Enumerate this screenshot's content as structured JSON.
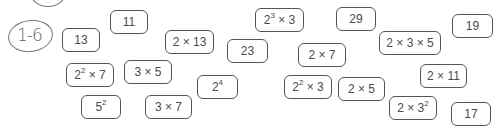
{
  "label": {
    "text": "1-6"
  },
  "cards": [
    {
      "id": "c13",
      "base": "13",
      "sup": "",
      "rest": "",
      "x": 62,
      "y": 28,
      "w": 38,
      "h": 24
    },
    {
      "id": "c11",
      "base": "11",
      "sup": "",
      "rest": "",
      "x": 110,
      "y": 10,
      "w": 38,
      "h": 24
    },
    {
      "id": "c2x13",
      "base": "2 × 13",
      "sup": "",
      "rest": "",
      "x": 165,
      "y": 30,
      "w": 49,
      "h": 24
    },
    {
      "id": "c2e3x3",
      "base": "2",
      "sup": "3",
      "rest": " × 3",
      "x": 255,
      "y": 8,
      "w": 49,
      "h": 24
    },
    {
      "id": "c23",
      "base": "23",
      "sup": "",
      "rest": "",
      "x": 227,
      "y": 39,
      "w": 41,
      "h": 24
    },
    {
      "id": "c29",
      "base": "29",
      "sup": "",
      "rest": "",
      "x": 336,
      "y": 7,
      "w": 40,
      "h": 24
    },
    {
      "id": "c2x7",
      "base": "2 × 7",
      "sup": "",
      "rest": "",
      "x": 298,
      "y": 43,
      "w": 48,
      "h": 24
    },
    {
      "id": "c2x3x5",
      "base": "2 × 3 × 5",
      "sup": "",
      "rest": "",
      "x": 379,
      "y": 31,
      "w": 62,
      "h": 24
    },
    {
      "id": "c19",
      "base": "19",
      "sup": "",
      "rest": "",
      "x": 452,
      "y": 14,
      "w": 41,
      "h": 24
    },
    {
      "id": "c2e2x7",
      "base": "2",
      "sup": "2",
      "rest": " × 7",
      "x": 66,
      "y": 63,
      "w": 48,
      "h": 24
    },
    {
      "id": "c3x5",
      "base": "3 × 5",
      "sup": "",
      "rest": "",
      "x": 124,
      "y": 60,
      "w": 48,
      "h": 24
    },
    {
      "id": "c2e4",
      "base": "2",
      "sup": "4",
      "rest": "",
      "x": 197,
      "y": 75,
      "w": 41,
      "h": 24
    },
    {
      "id": "c2e2x3",
      "base": "2",
      "sup": "2",
      "rest": " × 3",
      "x": 284,
      "y": 75,
      "w": 48,
      "h": 24
    },
    {
      "id": "c2x5",
      "base": "2 × 5",
      "sup": "",
      "rest": "",
      "x": 338,
      "y": 77,
      "w": 47,
      "h": 24
    },
    {
      "id": "c2x11",
      "base": "2 × 11",
      "sup": "",
      "rest": "",
      "x": 420,
      "y": 64,
      "w": 47,
      "h": 24
    },
    {
      "id": "c5e2",
      "base": "5",
      "sup": "2",
      "rest": "",
      "x": 81,
      "y": 95,
      "w": 40,
      "h": 24
    },
    {
      "id": "c3x7",
      "base": "3 × 7",
      "sup": "",
      "rest": "",
      "x": 145,
      "y": 95,
      "w": 47,
      "h": 24
    },
    {
      "id": "c2x3e2",
      "base": "2 × 3",
      "sup": "2",
      "rest": "",
      "x": 389,
      "y": 96,
      "w": 48,
      "h": 24
    },
    {
      "id": "c17",
      "base": "17",
      "sup": "",
      "rest": "",
      "x": 451,
      "y": 102,
      "w": 40,
      "h": 24
    }
  ]
}
